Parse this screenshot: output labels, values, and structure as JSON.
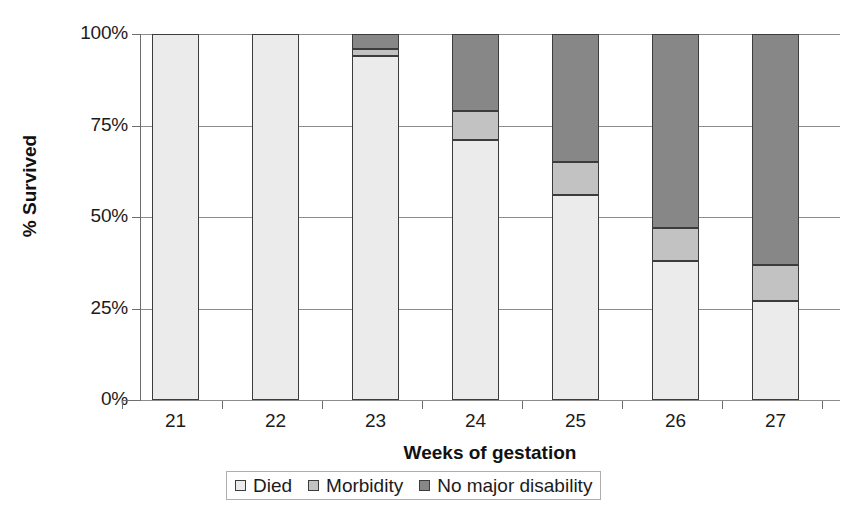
{
  "chart_data": {
    "type": "bar",
    "subtype": "stacked-bar-100-percent",
    "title": "",
    "xlabel": "Weeks of gestation",
    "ylabel": "% Survived",
    "categories": [
      "21",
      "22",
      "23",
      "24",
      "25",
      "26",
      "27"
    ],
    "ylim": [
      0,
      100
    ],
    "ytick_labels": [
      "0%",
      "25%",
      "50%",
      "75%",
      "100%"
    ],
    "ytick_values": [
      0,
      25,
      50,
      75,
      100
    ],
    "grid": true,
    "legend_position": "bottom",
    "series": [
      {
        "name": "Died",
        "color": "#ebebeb",
        "values": [
          100,
          100,
          94,
          71,
          56,
          38,
          27
        ]
      },
      {
        "name": "Morbidity",
        "color": "#c2c2c2",
        "values": [
          0,
          0,
          2,
          8,
          9,
          9,
          10
        ]
      },
      {
        "name": "No major disability",
        "color": "#878787",
        "values": [
          0,
          0,
          4,
          21,
          35,
          53,
          63
        ]
      }
    ]
  },
  "axes": {
    "y_title": "% Survived",
    "x_title": "Weeks of gestation"
  },
  "legend": {
    "items": [
      {
        "label": "Died",
        "swatch_color": "#ebebeb"
      },
      {
        "label": "Morbidity",
        "swatch_color": "#c2c2c2"
      },
      {
        "label": "No major disability",
        "swatch_color": "#878787"
      }
    ]
  },
  "colors": {
    "died": "#ebebeb",
    "morbidity": "#c2c2c2",
    "no_major_disability": "#878787",
    "gridline": "#8c8c8c",
    "axis": "#6e6e6e",
    "bar_outline": "#3c3c3c",
    "background": "#ffffff",
    "text": "#1b1b1b"
  }
}
